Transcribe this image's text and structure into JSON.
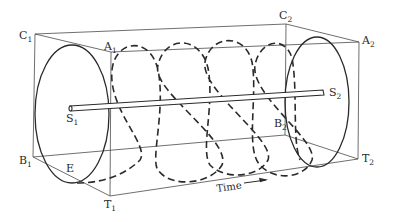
{
  "figure": {
    "labels": {
      "C1": {
        "main": "C",
        "sub": "1"
      },
      "A1": {
        "main": "A",
        "sub": "1"
      },
      "C2": {
        "main": "C",
        "sub": "2"
      },
      "A2": {
        "main": "A",
        "sub": "2"
      },
      "S1": {
        "main": "S",
        "sub": "1"
      },
      "S2": {
        "main": "S",
        "sub": "2"
      },
      "B1": {
        "main": "B",
        "sub": "1"
      },
      "B2": {
        "main": "B",
        "sub": "2"
      },
      "T1": {
        "main": "T",
        "sub": "1"
      },
      "T2": {
        "main": "T",
        "sub": "2"
      },
      "E": {
        "main": "E"
      }
    },
    "axis_label": "Time",
    "arrow_direction": "right",
    "colors": {
      "line": "#2a2a2a",
      "edge": "#4a4a4a",
      "background": "#ffffff"
    }
  }
}
